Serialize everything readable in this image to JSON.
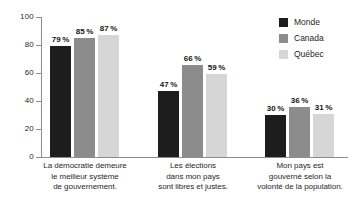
{
  "chart_data": {
    "type": "bar",
    "title": "",
    "subtitle": "",
    "xlabel": "",
    "ylabel": "",
    "ylim": [
      0,
      100
    ],
    "yticks": [
      0,
      20,
      40,
      60,
      80,
      100
    ],
    "ytick_labels": [
      "0",
      "20",
      "40",
      "60",
      "80",
      "100"
    ],
    "grid": false,
    "legend_position": "top-right",
    "categories": [
      "La démocratie demeure\nle meilleur système\nde gouvernement.",
      "Les élections\ndans mon pays\nsont libres et justes.",
      "Mon pays est\ngouverné selon la\nvolonté de la population."
    ],
    "category_lines": [
      [
        "La démocratie demeure",
        "le meilleur système",
        "de gouvernement."
      ],
      [
        "Les élections",
        "dans mon pays",
        "sont libres et justes."
      ],
      [
        "Mon pays est",
        "gouverné selon la",
        "volonté de la population."
      ]
    ],
    "series": [
      {
        "name": "Monde",
        "color": "#1d1d1d",
        "values": [
          79,
          85,
          87
        ],
        "labels": [
          "79 %",
          "85 %",
          "87 %"
        ]
      },
      {
        "name": "Canada",
        "color": "#8c8c8c",
        "values": [
          47,
          66,
          59
        ],
        "labels": [
          "47 %",
          "66 %",
          "59 %"
        ]
      },
      {
        "name": "Québec",
        "color": "#d6d6d6",
        "values": [
          30,
          36,
          31
        ],
        "labels": [
          "30 %",
          "36 %",
          "31 %"
        ]
      }
    ],
    "groups": [
      {
        "category_index": 0,
        "bars": [
          {
            "series": "Monde",
            "value": 79,
            "label": "79 %",
            "color": "#1d1d1d"
          },
          {
            "series": "Canada",
            "value": 85,
            "label": "85 %",
            "color": "#8c8c8c"
          },
          {
            "series": "Québec",
            "value": 87,
            "label": "87 %",
            "color": "#d6d6d6"
          }
        ]
      },
      {
        "category_index": 1,
        "bars": [
          {
            "series": "Monde",
            "value": 47,
            "label": "47 %",
            "color": "#1d1d1d"
          },
          {
            "series": "Canada",
            "value": 66,
            "label": "66 %",
            "color": "#8c8c8c"
          },
          {
            "series": "Québec",
            "value": 59,
            "label": "59 %",
            "color": "#d6d6d6"
          }
        ]
      },
      {
        "category_index": 2,
        "bars": [
          {
            "series": "Monde",
            "value": 30,
            "label": "30 %",
            "color": "#1d1d1d"
          },
          {
            "series": "Canada",
            "value": 36,
            "label": "36 %",
            "color": "#8c8c8c"
          },
          {
            "series": "Québec",
            "value": 31,
            "label": "31 %",
            "color": "#d6d6d6"
          }
        ]
      }
    ]
  },
  "legend": {
    "items": [
      {
        "label": "Monde",
        "color": "#1d1d1d"
      },
      {
        "label": "Canada",
        "color": "#8c8c8c"
      },
      {
        "label": "Québec",
        "color": "#d6d6d6"
      }
    ]
  },
  "axis": {
    "y_tick_labels": [
      "100",
      "80",
      "60",
      "40",
      "20",
      "0"
    ]
  }
}
